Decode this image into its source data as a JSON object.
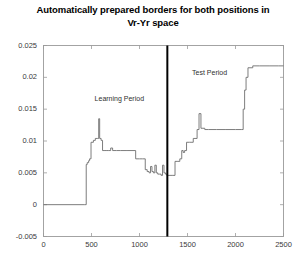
{
  "chart_data": {
    "type": "line",
    "title": "Automatically prepared borders for both positions in Vr-Yr space",
    "title_line1": "Automatically prepared borders for both positions in",
    "title_line2": "Vr-Yr space",
    "xlabel": "",
    "ylabel": "",
    "xlim": [
      0,
      2500
    ],
    "ylim": [
      -0.005,
      0.025
    ],
    "xticks": [
      0,
      500,
      1000,
      1500,
      2000,
      2500
    ],
    "xtick_labels": [
      "0",
      "500",
      "1000",
      "1500",
      "2000",
      "2500"
    ],
    "yticks": [
      -0.005,
      0,
      0.005,
      0.01,
      0.015,
      0.02,
      0.025
    ],
    "ytick_labels": [
      "-0.005",
      "0",
      "0.005",
      "0.01",
      "0.015",
      "0.02",
      "0.025"
    ],
    "grid": false,
    "legend": false,
    "line_color": "#6e6e6e",
    "line_width": 0.9,
    "drawstyle": "steps-post",
    "series": [
      {
        "name": "border",
        "x": [
          0,
          430,
          445,
          455,
          470,
          480,
          495,
          520,
          540,
          560,
          575,
          585,
          600,
          615,
          640,
          660,
          680,
          700,
          720,
          760,
          800,
          860,
          880,
          960,
          1000,
          1030,
          1060,
          1080,
          1100,
          1115,
          1130,
          1145,
          1160,
          1175,
          1190,
          1210,
          1225,
          1240,
          1255,
          1270,
          1285,
          1290,
          1340,
          1370,
          1400,
          1420,
          1440,
          1455,
          1470,
          1490,
          1520,
          1560,
          1600,
          1620,
          1640,
          1660,
          1680,
          1720,
          1800,
          1900,
          2000,
          2060,
          2080,
          2095,
          2110,
          2130,
          2180,
          2250,
          2350,
          2450,
          2500
        ],
        "y": [
          0.0,
          0.0,
          0.0063,
          0.0066,
          0.0069,
          0.0072,
          0.0098,
          0.0101,
          0.0104,
          0.0104,
          0.0135,
          0.0104,
          0.0101,
          0.0085,
          0.0085,
          0.0085,
          0.0085,
          0.0089,
          0.0085,
          0.0085,
          0.0085,
          0.0085,
          0.0085,
          0.0072,
          0.0072,
          0.0072,
          0.0055,
          0.0052,
          0.005,
          0.006,
          0.0052,
          0.005,
          0.0062,
          0.005,
          0.0048,
          0.0048,
          0.0046,
          0.0062,
          0.005,
          0.0048,
          0.0046,
          0.0046,
          0.0046,
          0.0068,
          0.0068,
          0.0072,
          0.0085,
          0.0082,
          0.0085,
          0.0098,
          0.0098,
          0.0104,
          0.0118,
          0.0143,
          0.012,
          0.012,
          0.0118,
          0.0118,
          0.0118,
          0.0118,
          0.0118,
          0.0118,
          0.015,
          0.018,
          0.02,
          0.0215,
          0.0218,
          0.0218,
          0.0218,
          0.0218,
          0.0218
        ]
      }
    ],
    "vertical_divider": {
      "x": 1290,
      "color": "#000000",
      "width": 2,
      "label": "period-split"
    },
    "annotations": [
      {
        "text": "Learning Period",
        "x": 790,
        "y": 0.0165,
        "name": "learning-period-label"
      },
      {
        "text": "Test Period",
        "x": 1730,
        "y": 0.0206,
        "name": "test-period-label"
      }
    ]
  },
  "axes": {
    "frame_color": "#9a9a9a",
    "background": "#ffffff"
  }
}
